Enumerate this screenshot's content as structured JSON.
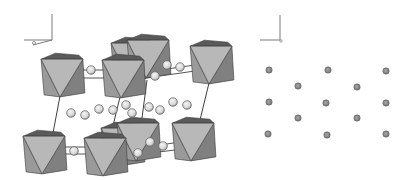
{
  "diagram": {
    "type": "crystal-structure",
    "panels": [
      {
        "name": "polyhedral-view",
        "content": "octahedra with interstitial spheres and unit cell"
      },
      {
        "name": "atom-projection",
        "content": "projected atom positions, 13 sites"
      }
    ],
    "colors": {
      "background": "#ffffff",
      "oct_light": "#b8b8b8",
      "oct_dark": "#808080",
      "oct_mid": "#9a9a9a",
      "oct_top": "#5a5a5a",
      "edge": "#3a3a3a",
      "sphere_fill": "#d8d8d8",
      "sphere_edge": "#6a6a6a",
      "cell_line": "#2a2a2a",
      "axis": "#7a7a7a",
      "dot_fill": "#8a8a8a",
      "dot_edge": "#5a5a5a"
    },
    "axes_left": {
      "origin": [
        52,
        40
      ],
      "up": [
        52,
        14
      ],
      "left": [
        24,
        40
      ],
      "diag": [
        33,
        45
      ]
    },
    "axes_right": {
      "origin": [
        280,
        40
      ],
      "up": [
        280,
        15
      ],
      "left": [
        260,
        40
      ]
    },
    "octahedra": [
      {
        "cx": 132,
        "cy": 60,
        "s": 22,
        "back": true
      },
      {
        "cx": 148,
        "cy": 57,
        "s": 22,
        "back": true
      },
      {
        "cx": 62,
        "cy": 76,
        "s": 22
      },
      {
        "cx": 123,
        "cy": 77,
        "s": 22
      },
      {
        "cx": 211,
        "cy": 63,
        "s": 22
      },
      {
        "cx": 122,
        "cy": 145,
        "s": 22,
        "back": true
      },
      {
        "cx": 138,
        "cy": 140,
        "s": 22,
        "back": true
      },
      {
        "cx": 44,
        "cy": 153,
        "s": 22
      },
      {
        "cx": 105,
        "cy": 155,
        "s": 22
      },
      {
        "cx": 193,
        "cy": 140,
        "s": 22
      }
    ],
    "spheres": [
      [
        91,
        70
      ],
      [
        167,
        65
      ],
      [
        180,
        67
      ],
      [
        155,
        76
      ],
      [
        71,
        113
      ],
      [
        85,
        115
      ],
      [
        99,
        109
      ],
      [
        113,
        110
      ],
      [
        126,
        105
      ],
      [
        132,
        113
      ],
      [
        149,
        107
      ],
      [
        160,
        110
      ],
      [
        173,
        102
      ],
      [
        187,
        105
      ],
      [
        74,
        151
      ],
      [
        150,
        142
      ],
      [
        163,
        146
      ],
      [
        138,
        153
      ]
    ],
    "cell_lines": [
      [
        [
          60,
          96
        ],
        [
          53,
          133
        ]
      ],
      [
        [
          120,
          97
        ],
        [
          111,
          134
        ]
      ],
      [
        [
          209,
          83
        ],
        [
          200,
          120
        ]
      ],
      [
        [
          147,
          80
        ],
        [
          142,
          118
        ]
      ]
    ],
    "bonds": [
      [
        [
          77,
          78
        ],
        [
          110,
          78
        ]
      ],
      [
        [
          78,
          70
        ],
        [
          108,
          70
        ]
      ],
      [
        [
          160,
          70
        ],
        [
          195,
          65
        ]
      ],
      [
        [
          160,
          76
        ],
        [
          195,
          71
        ]
      ],
      [
        [
          58,
          154
        ],
        [
          92,
          154
        ]
      ],
      [
        [
          60,
          147
        ],
        [
          90,
          147
        ]
      ],
      [
        [
          160,
          145
        ],
        [
          180,
          142
        ]
      ],
      [
        [
          150,
          153
        ],
        [
          175,
          150
        ]
      ]
    ],
    "atom_dots": [
      [
        269,
        70
      ],
      [
        328,
        70
      ],
      [
        386,
        71
      ],
      [
        298,
        86
      ],
      [
        357,
        87
      ],
      [
        269,
        102
      ],
      [
        326,
        103
      ],
      [
        386,
        103
      ],
      [
        298,
        118
      ],
      [
        357,
        118
      ],
      [
        268,
        134
      ],
      [
        327,
        135
      ],
      [
        386,
        134
      ]
    ],
    "atom_dot_radius": 3.2
  }
}
